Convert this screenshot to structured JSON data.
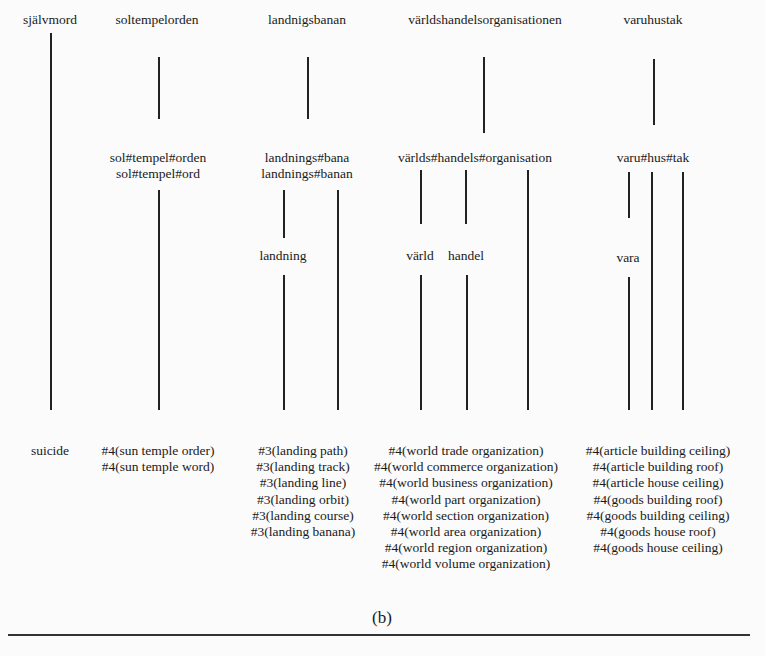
{
  "roots": [
    "självmord",
    "soltempelorden",
    "landnigsbanan",
    "världshandelsorganisationen",
    "varuhustak"
  ],
  "segmentations": {
    "soltempelorden": [
      "sol#tempel#orden",
      "sol#tempel#ord"
    ],
    "landnigsbanan": [
      "landnings#bana",
      "landnings#banan"
    ],
    "varldshandels": [
      "världs#handels#organisation"
    ],
    "varuhustak": [
      "varu#hus#tak"
    ]
  },
  "subwords": {
    "landning": "landning",
    "varld": "värld",
    "handel": "handel",
    "vara": "vara"
  },
  "translations": {
    "sjalvmord": [
      "suicide"
    ],
    "soltempelorden": [
      "#4(sun temple order)",
      "#4(sun temple word)"
    ],
    "landnigsbanan": [
      "#3(landing path)",
      "#3(landing track)",
      "#3(landing line)",
      "#3(landing orbit)",
      "#3(landing course)",
      "#3(landing banana)"
    ],
    "varldshandels": [
      "#4(world trade organization)",
      "#4(world commerce organization)",
      "#4(world business organization)",
      "#4(world part organization)",
      "#4(world section organization)",
      "#4(world area organization)",
      "#4(world region organization)",
      "#4(world volume organization)"
    ],
    "varuhustak": [
      "#4(article building ceiling)",
      "#4(article building roof)",
      "#4(article house ceiling)",
      "#4(goods building roof)",
      "#4(goods building ceiling)",
      "#4(goods house roof)",
      "#4(goods house ceiling)"
    ]
  },
  "caption": "(b)"
}
